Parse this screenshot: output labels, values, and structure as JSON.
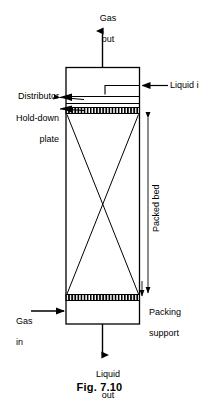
{
  "figure": {
    "caption": "Fig. 7.10",
    "title_internal": "Packed bed absorption column"
  },
  "labels": {
    "gas_out_line1": "Gas",
    "gas_out_line2": "out",
    "liquid_in": "Liquid in",
    "distributor": "Distributor",
    "hold_down_line1": "Hold-down",
    "hold_down_line2": "plate",
    "packed_bed": "Packed bed",
    "packing_support_line1": "Packing",
    "packing_support_line2": "support",
    "gas_in_line1": "Gas",
    "gas_in_line2": "in",
    "liquid_out_line1": "Liquid",
    "liquid_out_line2": "out"
  },
  "colors": {
    "stroke": "#000000",
    "background": "#ffffff",
    "fill": "#ffffff"
  }
}
